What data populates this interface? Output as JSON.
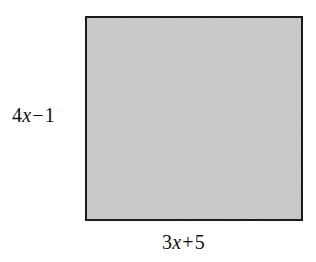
{
  "figure": {
    "type": "geometry-diagram",
    "shape": "rectangle",
    "background_color": "#ffffff",
    "fill_color": "#c9c9c9",
    "stroke_color": "#1a1a1a",
    "stroke_width_px": 2,
    "rect_bounds_px": {
      "x": 85,
      "y": 16,
      "width": 218,
      "height": 205
    }
  },
  "labels": {
    "height": {
      "full_text": "4x − 1",
      "coefficient": "4",
      "variable": "x",
      "operator": "−",
      "constant": "1",
      "position": "left"
    },
    "width": {
      "full_text": "3x + 5",
      "coefficient": "3",
      "variable": "x",
      "operator": "+",
      "constant": "5",
      "position": "bottom"
    }
  }
}
